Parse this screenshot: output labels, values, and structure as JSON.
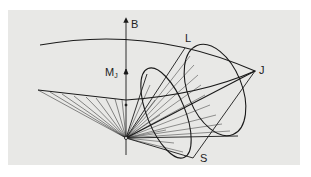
{
  "figure": {
    "type": "precession-cone-diagram",
    "background": "#e8e8e6",
    "line_color": "#1a1a1a",
    "labels": {
      "field_axis": "B",
      "orbital": "L",
      "total": "J",
      "spin": "S",
      "projection_main": "M",
      "projection_sub": "J"
    }
  }
}
